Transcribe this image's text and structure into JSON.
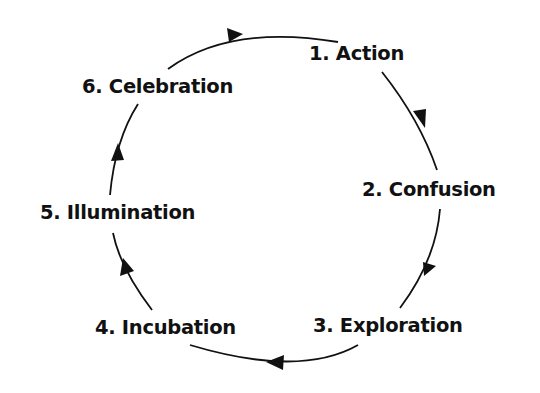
{
  "diagram": {
    "type": "cycle",
    "stroke_color": "#111111",
    "steps": [
      {
        "number": "1",
        "label": "1. Action"
      },
      {
        "number": "2",
        "label": "2. Confusion"
      },
      {
        "number": "3",
        "label": "3. Exploration"
      },
      {
        "number": "4",
        "label": "4. Incubation"
      },
      {
        "number": "5",
        "label": "5. Illumination"
      },
      {
        "number": "6",
        "label": "6. Celebration"
      }
    ],
    "direction": "clockwise"
  }
}
